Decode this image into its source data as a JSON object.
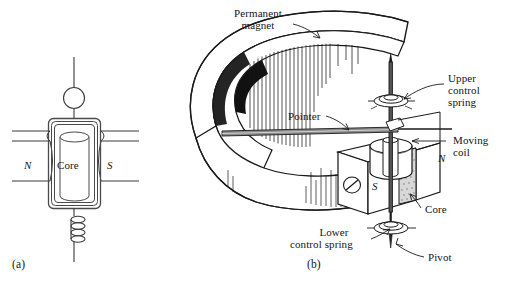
{
  "figure": {
    "background_color": "#ffffff",
    "ink_color": "#1a1a1a",
    "panels": [
      {
        "id": "a",
        "caption": "(a)",
        "description": "Top view schematic of moving coil between N and S pole pieces"
      },
      {
        "id": "b",
        "caption": "(b)",
        "description": "Pictorial view of permanent magnet, moving coil, core, pivot and control springs"
      }
    ]
  },
  "panel_a": {
    "caption": "(a)",
    "labels": {
      "north_pole": "N",
      "south_pole": "S",
      "core": "Core"
    }
  },
  "panel_b": {
    "caption": "(b)",
    "labels": {
      "permanent_magnet_line1": "Permanent",
      "permanent_magnet_line2": "magnet",
      "upper_spring_line1": "Upper",
      "upper_spring_line2": "control",
      "upper_spring_line3": "spring",
      "pointer": "Pointer",
      "moving_coil_line1": "Moving",
      "moving_coil_line2": "coil",
      "core": "Core",
      "lower_spring_line1": "Lower",
      "lower_spring_line2": "control spring",
      "pivot": "Pivot",
      "north_pole": "N",
      "south_pole": "S"
    }
  }
}
